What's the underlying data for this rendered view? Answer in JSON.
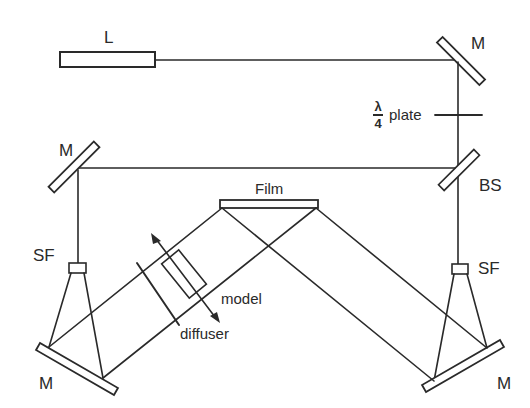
{
  "diagram": {
    "type": "holography optical setup",
    "colors": {
      "line": "#2a2a2a",
      "background": "#ffffff"
    },
    "labels": {
      "laser": "L",
      "mirror_top_right": "M",
      "wave_plate_numerator": "λ",
      "wave_plate_denominator": "4",
      "wave_plate_text": "plate",
      "mirror_left": "M",
      "beam_splitter": "BS",
      "film": "Film",
      "spatial_filter_left": "SF",
      "spatial_filter_right": "SF",
      "model": "model",
      "diffuser": "diffuser",
      "mirror_bottom_left": "M",
      "mirror_bottom_right": "M"
    }
  }
}
